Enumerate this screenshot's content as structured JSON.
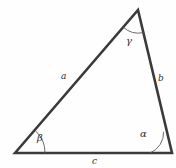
{
  "figure": {
    "background_color": "#fefefe",
    "stroke_color": "#3a3a3a",
    "arc_color": "#5a5a5a",
    "text_color": "#2e2e2e"
  },
  "triangle": {
    "vertices": {
      "bottom_left": {
        "x": 15,
        "y": 153
      },
      "bottom_right": {
        "x": 172,
        "y": 153
      },
      "apex": {
        "x": 138,
        "y": 10
      }
    },
    "path": "M 15,153 L 138,10 L 172,153 Z"
  },
  "sides": [
    {
      "id": "a",
      "label": "a",
      "from": "bottom_left",
      "to": "apex",
      "label_x": 61,
      "label_y": 72
    },
    {
      "id": "b",
      "label": "b",
      "from": "apex",
      "to": "bottom_right",
      "label_x": 158,
      "label_y": 74
    },
    {
      "id": "c",
      "label": "c",
      "from": "bottom_left",
      "to": "bottom_right",
      "label_x": 92,
      "label_y": 157
    }
  ],
  "angles": [
    {
      "id": "alpha",
      "label": "α",
      "vertex": "bottom_right",
      "arc_path": "M 150,153 A 22,22 0 0 0 163.6,131.8",
      "label_x": 140,
      "label_y": 129
    },
    {
      "id": "beta",
      "label": "β",
      "vertex": "bottom_left",
      "arc_path": "M 45,153 A 30,30 0 0 0 35.9,131.2",
      "label_x": 37,
      "label_y": 133
    },
    {
      "id": "gamma",
      "label": "γ",
      "vertex": "apex",
      "arc_path": "M 123.2,27.2 A 23,23 0 0 0 143.4,32.6",
      "label_x": 126,
      "label_y": 36
    }
  ]
}
